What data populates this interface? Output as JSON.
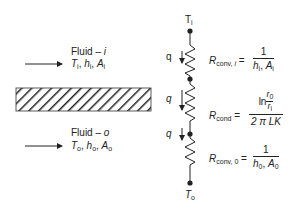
{
  "fluid_inner": {
    "title": "Fluid – ",
    "title_var": "i",
    "T": "T",
    "T_sub": "i",
    "h": "h",
    "h_sub": "i",
    "A": "A",
    "A_sub": "i",
    "sep": ", "
  },
  "fluid_outer": {
    "title": "Fluid – ",
    "title_var": "o",
    "T": "T",
    "T_sub": "o",
    "h": "h",
    "h_sub": "o",
    "A": "A",
    "A_sub": "o",
    "sep": ", "
  },
  "circuit": {
    "top_node": {
      "label": "T",
      "sub": "i"
    },
    "bottom_node": {
      "label": "T",
      "sub": "o"
    },
    "heat_flow_label": "q",
    "resistors": [
      {
        "R": "R",
        "R_sub": "conv, ",
        "R_sub_var": "i",
        "eq": " =",
        "num": "1",
        "den_h": "h",
        "den_h_sub": "i",
        "den_sep": ", ",
        "den_A": "A",
        "den_A_sub": "i"
      },
      {
        "R": "R",
        "R_sub": "cond",
        "eq": " =",
        "num_ln": "ln ",
        "num_r0": "r",
        "num_r0_sub": "0",
        "num_ri": "r",
        "num_ri_sub": "i",
        "den": "2 π LK"
      },
      {
        "R": "R",
        "R_sub": "conv, 0",
        "eq": " =",
        "num": "1",
        "den_h": "h",
        "den_h_sub": "0",
        "den_sep": ", ",
        "den_A": "A",
        "den_A_sub": "0"
      }
    ]
  },
  "colors": {
    "ink": "#222222",
    "background": "#ffffff"
  }
}
